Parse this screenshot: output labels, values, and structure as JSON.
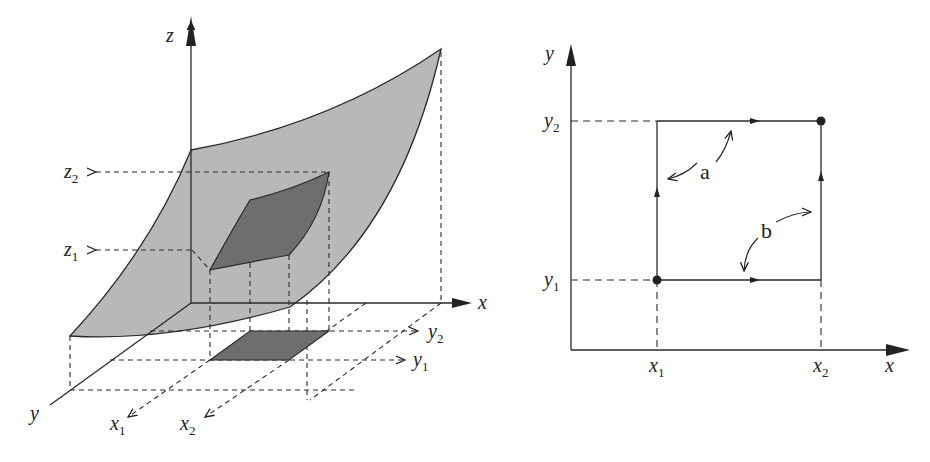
{
  "figure": {
    "left_panel": {
      "description": "3D surface z=f(x,y) with patch over rectangle [x1,x2]x[y1,y2]",
      "axes": {
        "x": "x",
        "y": "y",
        "z": "z"
      },
      "labels": {
        "z1": {
          "main": "z",
          "sub": "1"
        },
        "z2": {
          "main": "z",
          "sub": "2"
        },
        "x1": {
          "main": "x",
          "sub": "1"
        },
        "x2": {
          "main": "x",
          "sub": "2"
        },
        "y1": {
          "main": "y",
          "sub": "1"
        },
        "y2": {
          "main": "y",
          "sub": "2"
        }
      },
      "colors": {
        "surface": "#b8b8b8",
        "patch": "#6e6e6e",
        "line": "#2a2a2a"
      }
    },
    "right_panel": {
      "description": "Two integration paths in the xy-plane from (x1,y1) to (x2,y2)",
      "axes": {
        "x": "x",
        "y": "y"
      },
      "labels": {
        "x1": {
          "main": "x",
          "sub": "1"
        },
        "x2": {
          "main": "x",
          "sub": "2"
        },
        "y1": {
          "main": "y",
          "sub": "1"
        },
        "y2": {
          "main": "y",
          "sub": "2"
        }
      },
      "paths": [
        {
          "name": "a",
          "label": "a"
        },
        {
          "name": "b",
          "label": "b"
        }
      ]
    }
  }
}
